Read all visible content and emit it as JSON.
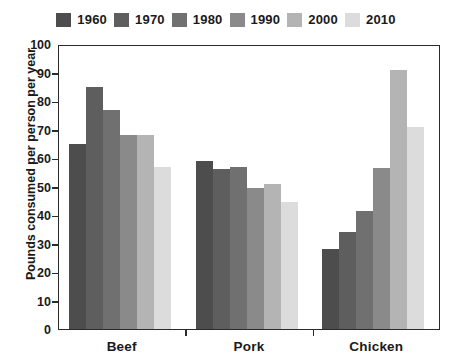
{
  "chart_data": {
    "type": "bar",
    "title": "",
    "xlabel": "",
    "ylabel": "Pounds consumed per person per year",
    "categories": [
      "Beef",
      "Pork",
      "Chicken"
    ],
    "ylim": [
      0,
      100
    ],
    "yticks": [
      "0",
      "10",
      "20",
      "30",
      "40",
      "50",
      "60",
      "70",
      "80",
      "90",
      "100"
    ],
    "grid": false,
    "legend_position": "top-center",
    "series": [
      {
        "name": "1960",
        "color": "#4d4d4d",
        "values": [
          65,
          59,
          28
        ]
      },
      {
        "name": "1970",
        "color": "#5e5e5e",
        "values": [
          85,
          56,
          34
        ]
      },
      {
        "name": "1980",
        "color": "#707070",
        "values": [
          77,
          57,
          41.5
        ]
      },
      {
        "name": "1990",
        "color": "#8a8a8a",
        "values": [
          68,
          49.5,
          56.5
        ]
      },
      {
        "name": "2000",
        "color": "#b4b4b4",
        "values": [
          68,
          51,
          91
        ]
      },
      {
        "name": "2010",
        "color": "#dcdcdc",
        "values": [
          57,
          44.5,
          71
        ]
      }
    ]
  },
  "axis": {
    "frame_color": "#2b2b2b",
    "background": "#ffffff"
  }
}
